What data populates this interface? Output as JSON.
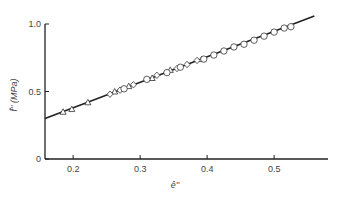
{
  "chart_data": {
    "type": "scatter",
    "title": "",
    "xlabel": "ê''",
    "ylabel": "f̂'' (MPa)",
    "xlim": [
      0.158,
      0.58
    ],
    "ylim": [
      0,
      1.05
    ],
    "grid": false,
    "legend": null,
    "x_ticks": [
      {
        "value": 0.2,
        "label": "0.2"
      },
      {
        "value": 0.3,
        "label": "0.3"
      },
      {
        "value": 0.4,
        "label": "0.4"
      },
      {
        "value": 0.5,
        "label": "0.5"
      }
    ],
    "y_ticks": [
      {
        "value": 0,
        "label": "0"
      },
      {
        "value": 0.5,
        "label": "0.5"
      },
      {
        "value": 1.0,
        "label": "1.0"
      }
    ],
    "fit_line": {
      "x": [
        0.158,
        0.56
      ],
      "y": [
        0.3,
        1.06
      ]
    },
    "series": [
      {
        "name": "triangles",
        "marker": "triangle",
        "x": [
          0.185,
          0.198,
          0.222,
          0.262,
          0.283,
          0.318,
          0.345,
          0.392
        ],
        "y": [
          0.35,
          0.37,
          0.42,
          0.5,
          0.54,
          0.6,
          0.66,
          0.74
        ]
      },
      {
        "name": "diamonds",
        "marker": "diamond",
        "x": [
          0.255,
          0.27,
          0.29,
          0.325,
          0.355,
          0.37,
          0.385
        ],
        "y": [
          0.48,
          0.51,
          0.55,
          0.62,
          0.67,
          0.7,
          0.73
        ]
      },
      {
        "name": "circles",
        "marker": "circle",
        "x": [
          0.276,
          0.31,
          0.34,
          0.36,
          0.395,
          0.41,
          0.425,
          0.44,
          0.455,
          0.47,
          0.485,
          0.5,
          0.515,
          0.525
        ],
        "y": [
          0.52,
          0.59,
          0.64,
          0.68,
          0.74,
          0.77,
          0.8,
          0.83,
          0.85,
          0.88,
          0.91,
          0.94,
          0.97,
          0.98
        ]
      }
    ]
  }
}
